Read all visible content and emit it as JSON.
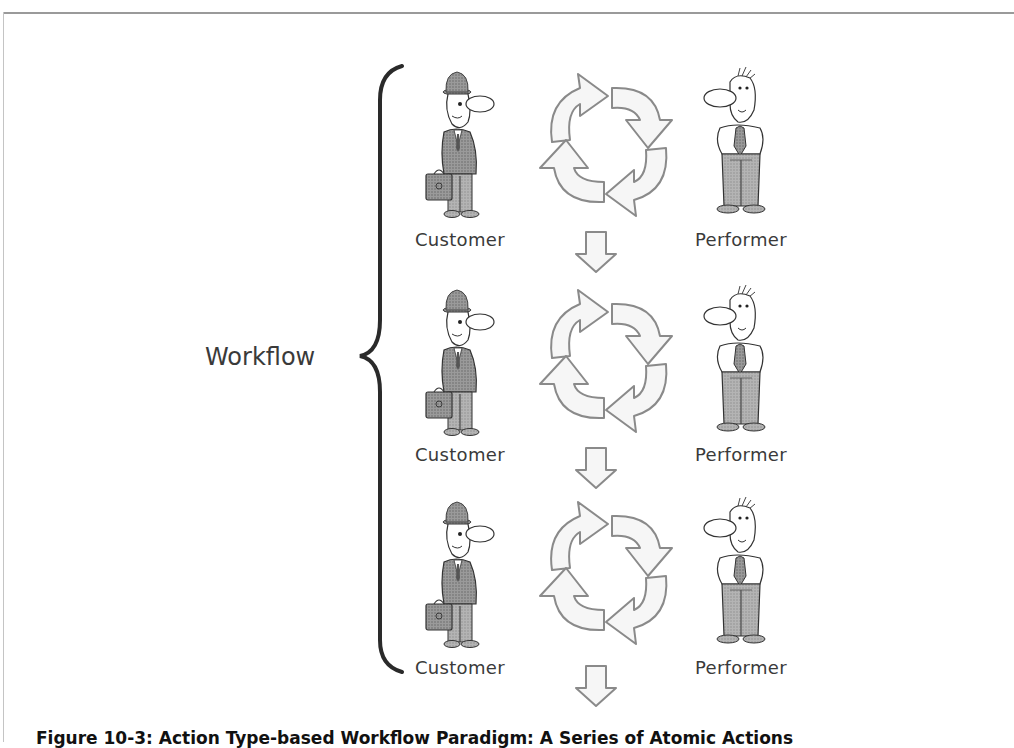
{
  "diagram": {
    "group_label": "Workflow",
    "rows": [
      {
        "customer_label": "Customer",
        "performer_label": "Performer"
      },
      {
        "customer_label": "Customer",
        "performer_label": "Performer"
      },
      {
        "customer_label": "Customer",
        "performer_label": "Performer"
      }
    ],
    "caption": "Figure 10-3: Action Type-based Workflow Paradigm: A Series of Atomic Actions",
    "colors": {
      "arrow_fill": "#f6f6f6",
      "arrow_stroke": "#8a8a8a",
      "brace": "#2a2a2a",
      "suit": "#8c8c8c",
      "pants": "#a8a8a8"
    }
  }
}
